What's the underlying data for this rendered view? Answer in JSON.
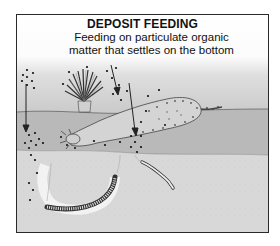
{
  "diagram": {
    "title": "DEPOSIT FEEDING",
    "subtitle_line1": "Feeding on particulate organic",
    "subtitle_line2": "matter that settles on the bottom",
    "layers": [
      "water",
      "sediment-surface",
      "deep-sediment"
    ],
    "organisms": [
      "feather-duster-worm",
      "sea-cucumber",
      "burrowing-worm",
      "thin-worm"
    ],
    "colors": {
      "frame": "#2a2a2a",
      "water_top": "#ffffff",
      "water_bottom": "#bdbdbd",
      "surface_band": "#b4b4b4",
      "deep_sediment": "#d9d9d9",
      "particle": "#1a1a1a"
    }
  }
}
